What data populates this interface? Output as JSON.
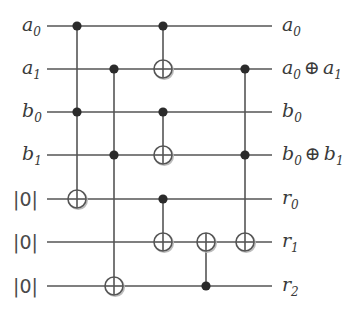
{
  "diagram": {
    "type": "quantum-circuit",
    "colors": {
      "wire": "#555555",
      "control": "#2b2b2b",
      "text": "#3a3a3a"
    },
    "wires": [
      {
        "id": "a0",
        "y": 26,
        "input": {
          "base": "a",
          "sub": "0"
        },
        "output": {
          "text": "a",
          "sub": "0",
          "extra": ""
        }
      },
      {
        "id": "a1",
        "y": 69,
        "input": {
          "base": "a",
          "sub": "1"
        },
        "output": {
          "text": "a",
          "sub": "0",
          "extra": "⊕",
          "text2": "a",
          "sub2": "1"
        }
      },
      {
        "id": "b0",
        "y": 112,
        "input": {
          "base": "b",
          "sub": "0"
        },
        "output": {
          "text": "b",
          "sub": "0",
          "extra": ""
        }
      },
      {
        "id": "b1",
        "y": 155,
        "input": {
          "base": "b",
          "sub": "1"
        },
        "output": {
          "text": "b",
          "sub": "0",
          "extra": "⊕",
          "text2": "b",
          "sub2": "1"
        }
      },
      {
        "id": "r0",
        "y": 199,
        "input": {
          "ket": "|0|"
        },
        "output": {
          "text": "r",
          "sub": "0",
          "extra": ""
        }
      },
      {
        "id": "r1",
        "y": 242,
        "input": {
          "ket": "|0|"
        },
        "output": {
          "text": "r",
          "sub": "1",
          "extra": ""
        }
      },
      {
        "id": "r2",
        "y": 286,
        "input": {
          "ket": "|0|"
        },
        "output": {
          "text": "r",
          "sub": "2",
          "extra": ""
        }
      }
    ],
    "wire_x_start": 47,
    "wire_x_end": 272,
    "gates": [
      {
        "column": 1,
        "x": 77,
        "controls": [
          "a0",
          "b0"
        ],
        "target": "r0"
      },
      {
        "column": 2,
        "x": 114,
        "controls": [
          "a1",
          "b1"
        ],
        "target": "r2"
      },
      {
        "column": 3,
        "x": 163,
        "controls": [
          "a0"
        ],
        "target": "a1"
      },
      {
        "column": 3,
        "x": 163,
        "controls": [
          "b0"
        ],
        "target": "b1"
      },
      {
        "column": 3,
        "x": 163,
        "controls": [
          "r0"
        ],
        "target": "r1"
      },
      {
        "column": 4,
        "x": 206,
        "controls": [
          "r2"
        ],
        "target": "r1"
      },
      {
        "column": 5,
        "x": 245,
        "controls": [
          "a1",
          "b1"
        ],
        "target": "r1"
      }
    ],
    "labels": {
      "ket_zero": "|0|",
      "xor_symbol": "⊕"
    }
  }
}
